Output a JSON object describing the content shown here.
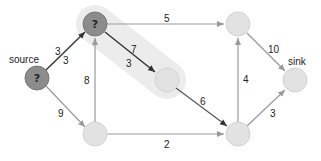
{
  "diagram": {
    "type": "flow-network",
    "highlight": {
      "from": "a",
      "to": "c",
      "color": "#ececec"
    },
    "colors": {
      "active_node_fill": "#8c8c8c",
      "active_node_stroke": "#777777",
      "inactive_node_fill": "#e2e2e2",
      "inactive_node_stroke": "#d2d2d2",
      "active_edge": "#333333",
      "inactive_edge": "#9a9a9a"
    },
    "nodes": [
      {
        "id": "source",
        "label": "source",
        "marker": "?",
        "active": true,
        "x": 37,
        "y": 78
      },
      {
        "id": "a",
        "label": "",
        "marker": "?",
        "active": true,
        "x": 95,
        "y": 24
      },
      {
        "id": "b",
        "label": "",
        "marker": "",
        "active": false,
        "x": 238,
        "y": 24
      },
      {
        "id": "c",
        "label": "",
        "marker": "",
        "active": false,
        "x": 167,
        "y": 80
      },
      {
        "id": "d",
        "label": "",
        "marker": "",
        "active": false,
        "x": 95,
        "y": 134
      },
      {
        "id": "e",
        "label": "",
        "marker": "",
        "active": false,
        "x": 238,
        "y": 134
      },
      {
        "id": "sink",
        "label": "sink",
        "marker": "",
        "active": false,
        "x": 295,
        "y": 80
      }
    ],
    "edges": [
      {
        "from": "source",
        "to": "a",
        "capacity": "3",
        "flow": "3",
        "active": true
      },
      {
        "from": "source",
        "to": "d",
        "capacity": "9",
        "active": false
      },
      {
        "from": "a",
        "to": "b",
        "capacity": "5",
        "active": false
      },
      {
        "from": "a",
        "to": "c",
        "capacity": "7",
        "flow": "3",
        "active": true
      },
      {
        "from": "d",
        "to": "a",
        "capacity": "8",
        "active": false
      },
      {
        "from": "d",
        "to": "e",
        "capacity": "2",
        "active": false
      },
      {
        "from": "c",
        "to": "e",
        "capacity": "6",
        "active": false
      },
      {
        "from": "e",
        "to": "b",
        "capacity": "4",
        "active": false
      },
      {
        "from": "b",
        "to": "sink",
        "capacity": "10",
        "active": false
      },
      {
        "from": "e",
        "to": "sink",
        "capacity": "3",
        "active": false
      }
    ],
    "labels": {
      "source_label": "source",
      "sink_label": "sink",
      "source_marker": "?",
      "a_marker": "?",
      "e_source_a_capacity": "3",
      "e_source_a_flow": "3",
      "e_source_d": "9",
      "e_a_b": "5",
      "e_a_c_capacity": "7",
      "e_a_c_flow": "3",
      "e_d_a": "8",
      "e_d_e": "2",
      "e_c_e": "6",
      "e_e_b": "4",
      "e_b_sink": "10",
      "e_e_sink": "3"
    }
  }
}
